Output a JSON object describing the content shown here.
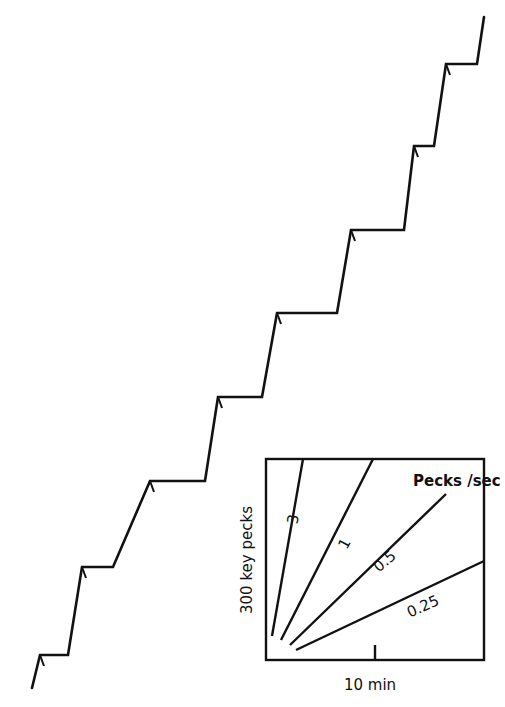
{
  "chart_data": {
    "type": "line",
    "title": "",
    "main_record": {
      "name": "cumulative-record",
      "points": [
        [
          32,
          688
        ],
        [
          40,
          655
        ],
        [
          68,
          655
        ],
        [
          82,
          567
        ],
        [
          113,
          567
        ],
        [
          150,
          481
        ],
        [
          205,
          481
        ],
        [
          218,
          397
        ],
        [
          262,
          397
        ],
        [
          277,
          313
        ],
        [
          337,
          313
        ],
        [
          351,
          230
        ],
        [
          404,
          230
        ],
        [
          414,
          146
        ],
        [
          434,
          146
        ],
        [
          446,
          64
        ],
        [
          477,
          64
        ],
        [
          484,
          17
        ]
      ],
      "hatch_marks": [
        [
          40,
          655
        ],
        [
          82,
          567
        ],
        [
          150,
          481
        ],
        [
          218,
          397
        ],
        [
          277,
          313
        ],
        [
          351,
          230
        ],
        [
          414,
          146
        ],
        [
          446,
          64
        ]
      ],
      "steps": 8
    },
    "inset": {
      "box": {
        "x": 266,
        "y": 459,
        "width": 218,
        "height": 201
      },
      "legend_title": "Pecks /sec",
      "xlabel": "10 min",
      "ylabel": "300  key  pecks",
      "x_tick": {
        "x": 375,
        "y1": 645,
        "y2": 660
      },
      "series": [
        {
          "name": "3",
          "rate": 3,
          "line": [
            [
              272,
              636
            ],
            [
              303,
              459
            ]
          ],
          "label_pos": [
            298,
            520
          ],
          "label_rot": -80
        },
        {
          "name": "1",
          "rate": 1,
          "line": [
            [
              281,
              640
            ],
            [
              373,
              459
            ]
          ],
          "label_pos": [
            349,
            546
          ],
          "label_rot": -62
        },
        {
          "name": "0.5",
          "rate": 0.5,
          "line": [
            [
              290,
              645
            ],
            [
              446,
              494
            ]
          ],
          "label_pos": [
            388,
            565
          ],
          "label_rot": -40
        },
        {
          "name": "0.25",
          "rate": 0.25,
          "line": [
            [
              296,
              650
            ],
            [
              484,
              561
            ]
          ],
          "label_pos": [
            425,
            611
          ],
          "label_rot": -24
        }
      ]
    }
  },
  "colors": {
    "ink": "#111111",
    "background": "#ffffff"
  }
}
